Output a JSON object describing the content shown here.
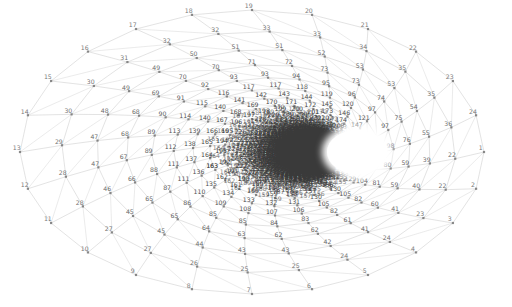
{
  "figure": {
    "kind": "graph-drawing",
    "title": "",
    "background": "#ffffff",
    "width": 512,
    "height": 307,
    "edge_color": "#8d8d8d",
    "node_color": "#777777",
    "label_color": "#3a3a3a",
    "node_marker": "square",
    "node_size_px": 2.2,
    "label_font_px": 6.2,
    "edge_width_px": 0.45
  },
  "layout": {
    "description": "concentric elliptical rings spiralling inward toward an empty elliptical core",
    "outer_center": [
      252,
      152
    ],
    "outer_radius_x": 232,
    "outer_radius_y": 142,
    "core_center": [
      357,
      152
    ],
    "core_radius_x": 37,
    "core_radius_y": 27,
    "ring_count": 30,
    "spokes": 24,
    "ring_shrink": 0.845,
    "spiral_twist_deg": 3.2,
    "center_drift_x": 105,
    "center_drift_y": 0
  },
  "core_hole": {
    "center": [
      357,
      152
    ],
    "radius_x": 30,
    "radius_y": 22,
    "fill": "#ffffff"
  },
  "chart_data": {
    "type": "scatter",
    "title": "",
    "xlabel": "",
    "ylabel": "",
    "node_count": 432,
    "max_label": 432,
    "outer_ring_labels": [
      1,
      2,
      3,
      4,
      5,
      6,
      7,
      8,
      9,
      10,
      11,
      12,
      13,
      14,
      15,
      16,
      17,
      18,
      19,
      20,
      21,
      22,
      23,
      24,
      25,
      26,
      27,
      28,
      29,
      30,
      31,
      32,
      33,
      34,
      35,
      36
    ],
    "second_ring_labels": [
      37,
      38,
      39,
      40,
      41,
      42,
      43,
      44,
      45,
      46,
      48,
      49,
      50,
      52,
      54,
      56,
      58,
      60,
      62,
      63,
      65,
      66,
      67,
      68,
      72,
      73,
      74,
      75,
      76,
      77,
      81,
      83,
      84,
      88,
      90,
      92,
      93,
      94,
      97,
      99
    ],
    "third_ring_labels": [
      104,
      105,
      107,
      108,
      109,
      110,
      111,
      112,
      113,
      114,
      117,
      118,
      119,
      120,
      121,
      122,
      123,
      124,
      127,
      128,
      130,
      131,
      132,
      136,
      138,
      139,
      140,
      146,
      147,
      148,
      149,
      150,
      151,
      152,
      153,
      154,
      155,
      156,
      157,
      160,
      161,
      162,
      163,
      164,
      165,
      166,
      169,
      170,
      173,
      174,
      177,
      181,
      182,
      183,
      185,
      186,
      188,
      189,
      190,
      193,
      194,
      195,
      196,
      197,
      198,
      199,
      200,
      203,
      204,
      205,
      207,
      208
    ],
    "deep_ring_labels": [
      210,
      211,
      213,
      214,
      216,
      217,
      218,
      219,
      220,
      221,
      222,
      223,
      224,
      225,
      228,
      229,
      230,
      231,
      232,
      234,
      235,
      236,
      238,
      241,
      242,
      243,
      245,
      246,
      247,
      249,
      251,
      252,
      253,
      254,
      255,
      256,
      259,
      260,
      261,
      262,
      263,
      264,
      266,
      267,
      268,
      271,
      273,
      275,
      277,
      285,
      287,
      289,
      290,
      292,
      293,
      294,
      296,
      297,
      298,
      299,
      300,
      301,
      306,
      311,
      313,
      315,
      317,
      321,
      331,
      332,
      333,
      334,
      336,
      337,
      341,
      344,
      347,
      363,
      364,
      371,
      374
    ]
  },
  "annotations": {
    "visible_low_numbers_top": [
      "28",
      "30",
      "38",
      "32",
      "40",
      "42",
      "34",
      "36",
      "44",
      "35",
      "50",
      "60",
      "33",
      "68",
      "31",
      "29"
    ],
    "visible_low_numbers_left": [
      "26",
      "24",
      "23",
      "21",
      "19",
      "17",
      "16",
      "14",
      "12",
      "10"
    ],
    "visible_low_numbers_bottom": [
      "8",
      "6",
      "37",
      "39",
      "21",
      "41",
      "4",
      "73",
      "43",
      "77",
      "83",
      "49",
      "2",
      "91",
      "59",
      "3",
      "67",
      "7",
      "9"
    ],
    "visible_low_numbers_right": [
      "27",
      "25",
      "22",
      "20",
      "18",
      "15",
      "13",
      "11"
    ]
  }
}
